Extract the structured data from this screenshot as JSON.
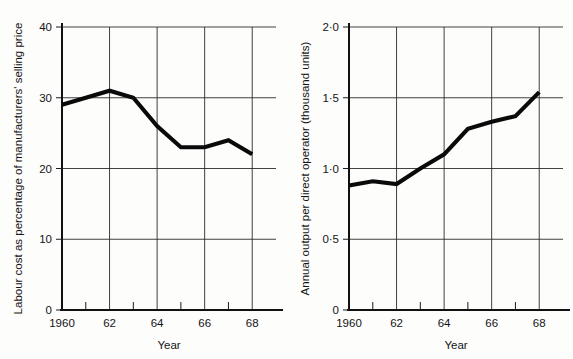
{
  "figure": {
    "background_color": "#fdfdfc",
    "line_color": "#0a0a0a",
    "grid_color": "#2b2b2b",
    "axis_color": "#111111"
  },
  "chart_data": [
    {
      "type": "line",
      "panel": "left",
      "title": "",
      "xlabel": "Year",
      "ylabel": "Labour cost as percentage of manufacturers' selling price",
      "x": [
        1960,
        1961,
        1962,
        1963,
        1964,
        1965,
        1966,
        1967,
        1968
      ],
      "values": [
        29,
        30,
        31,
        30,
        26,
        23,
        23,
        24,
        22
      ],
      "xlim": [
        1960,
        1969
      ],
      "ylim": [
        0,
        40
      ],
      "yticks": [
        0,
        10,
        20,
        30,
        40
      ],
      "ytick_labels": [
        "0",
        "10",
        "20",
        "30",
        "40"
      ],
      "xticks": [
        1960,
        1962,
        1964,
        1966,
        1968
      ],
      "xtick_labels": [
        "1960",
        "62",
        "64",
        "66",
        "68"
      ],
      "xticks_minor": [
        1961,
        1963,
        1965,
        1967
      ],
      "grid": true,
      "legend": "none"
    },
    {
      "type": "line",
      "panel": "right",
      "title": "",
      "xlabel": "Year",
      "ylabel": "Annual output per direct operator (thousand units)",
      "x": [
        1960,
        1961,
        1962,
        1963,
        1964,
        1965,
        1966,
        1967,
        1968
      ],
      "values": [
        0.88,
        0.91,
        0.89,
        1.0,
        1.1,
        1.28,
        1.33,
        1.37,
        1.54
      ],
      "xlim": [
        1960,
        1969
      ],
      "ylim": [
        0,
        2.0
      ],
      "yticks": [
        0,
        0.5,
        1.0,
        1.5,
        2.0
      ],
      "ytick_labels": [
        "0",
        "0·5",
        "1·0",
        "1·5",
        "2·0"
      ],
      "xticks": [
        1960,
        1962,
        1964,
        1966,
        1968
      ],
      "xtick_labels": [
        "1960",
        "62",
        "64",
        "66",
        "68"
      ],
      "xticks_minor": [
        1961,
        1963,
        1965,
        1967
      ],
      "grid": true,
      "legend": "none"
    }
  ]
}
